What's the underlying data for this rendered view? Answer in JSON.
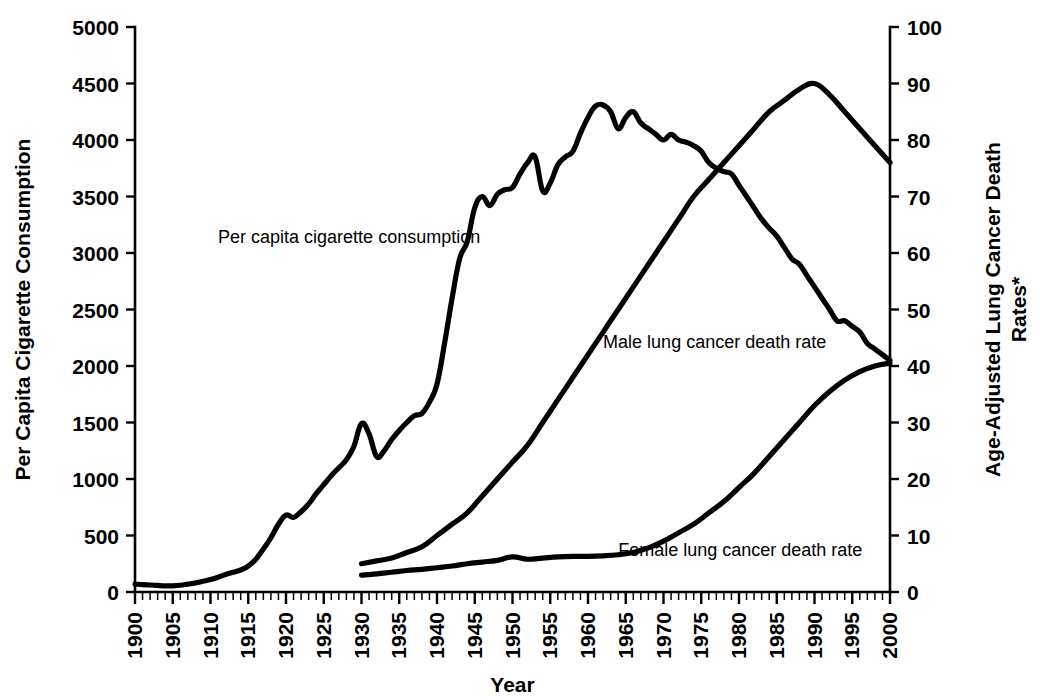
{
  "chart_data": {
    "type": "line",
    "title": "",
    "xlabel": "Year",
    "ylabel": "Per Capita Cigarette Consumption",
    "y2label": "Age-Adjusted Lung Cancer Death Rates*",
    "y2label_line1": "Age-Adjusted Lung Cancer Death",
    "y2label_line2": "Rates*",
    "xlim": [
      1900,
      2000
    ],
    "ylim": [
      0,
      5000
    ],
    "y2lim": [
      0,
      100
    ],
    "grid": false,
    "legend": "inline-annotations",
    "x_ticks": [
      1900,
      1905,
      1910,
      1915,
      1920,
      1925,
      1930,
      1935,
      1940,
      1945,
      1950,
      1955,
      1960,
      1965,
      1970,
      1975,
      1980,
      1985,
      1990,
      1995,
      2000
    ],
    "x_minor_tick_step": 1,
    "y_ticks": [
      0,
      500,
      1000,
      1500,
      2000,
      2500,
      3000,
      3500,
      4000,
      4500,
      5000
    ],
    "y2_ticks": [
      0,
      10,
      20,
      30,
      40,
      50,
      60,
      70,
      80,
      90,
      100
    ],
    "annotations": [
      {
        "text": "Per capita cigarette consumption",
        "x": 1911,
        "y_px": 243
      },
      {
        "text": "Male lung cancer death rate",
        "x": 1962,
        "y_px": 348
      },
      {
        "text": "Female lung cancer death rate",
        "x": 1964,
        "y_px": 556
      }
    ],
    "series": [
      {
        "name": "Per capita cigarette consumption",
        "axis": "left",
        "units": "cigarettes per capita per year",
        "x": [
          1900,
          1901,
          1902,
          1903,
          1904,
          1905,
          1906,
          1907,
          1908,
          1909,
          1910,
          1911,
          1912,
          1913,
          1914,
          1915,
          1916,
          1917,
          1918,
          1919,
          1920,
          1921,
          1922,
          1923,
          1924,
          1925,
          1926,
          1927,
          1928,
          1929,
          1930,
          1931,
          1932,
          1933,
          1934,
          1935,
          1936,
          1937,
          1938,
          1939,
          1940,
          1941,
          1942,
          1943,
          1944,
          1945,
          1946,
          1947,
          1948,
          1949,
          1950,
          1951,
          1952,
          1953,
          1954,
          1955,
          1956,
          1957,
          1958,
          1959,
          1960,
          1961,
          1962,
          1963,
          1964,
          1965,
          1966,
          1967,
          1968,
          1969,
          1970,
          1971,
          1972,
          1973,
          1974,
          1975,
          1976,
          1977,
          1978,
          1979,
          1980,
          1981,
          1982,
          1983,
          1984,
          1985,
          1986,
          1987,
          1988,
          1989,
          1990,
          1991,
          1992,
          1993,
          1994,
          1995,
          1996,
          1997,
          1998,
          1999,
          2000
        ],
        "y": [
          70,
          65,
          62,
          58,
          55,
          55,
          60,
          70,
          80,
          95,
          110,
          130,
          155,
          175,
          195,
          230,
          290,
          380,
          480,
          600,
          680,
          660,
          710,
          780,
          870,
          950,
          1030,
          1100,
          1170,
          1290,
          1490,
          1400,
          1200,
          1250,
          1350,
          1430,
          1500,
          1560,
          1580,
          1680,
          1840,
          2200,
          2600,
          2950,
          3100,
          3400,
          3500,
          3420,
          3520,
          3560,
          3580,
          3700,
          3800,
          3850,
          3550,
          3620,
          3780,
          3850,
          3900,
          4060,
          4200,
          4300,
          4310,
          4250,
          4100,
          4200,
          4250,
          4150,
          4100,
          4050,
          4000,
          4050,
          4000,
          3980,
          3950,
          3900,
          3800,
          3750,
          3720,
          3700,
          3600,
          3500,
          3400,
          3300,
          3220,
          3150,
          3050,
          2950,
          2900,
          2800,
          2700,
          2600,
          2500,
          2400,
          2400,
          2350,
          2300,
          2200,
          2150,
          2100,
          2050
        ]
      },
      {
        "name": "Male lung cancer death rate",
        "axis": "right",
        "units": "deaths per 100,000 population",
        "x": [
          1930,
          1932,
          1934,
          1936,
          1938,
          1940,
          1942,
          1944,
          1946,
          1948,
          1950,
          1952,
          1954,
          1956,
          1958,
          1960,
          1962,
          1964,
          1966,
          1968,
          1970,
          1972,
          1974,
          1976,
          1978,
          1980,
          1982,
          1984,
          1986,
          1988,
          1990,
          1992,
          1994,
          1996,
          1998,
          2000
        ],
        "y": [
          5,
          5.5,
          6,
          7,
          8,
          10,
          12,
          14,
          17,
          20,
          23,
          26,
          30,
          34,
          38,
          42,
          46,
          50,
          54,
          58,
          62,
          66,
          70,
          73,
          76,
          79,
          82,
          85,
          87,
          89,
          90,
          88,
          85,
          82,
          79,
          76
        ]
      },
      {
        "name": "Female lung cancer death rate",
        "axis": "right",
        "units": "deaths per 100,000 population",
        "x": [
          1930,
          1932,
          1934,
          1936,
          1938,
          1940,
          1942,
          1944,
          1946,
          1948,
          1950,
          1952,
          1954,
          1956,
          1958,
          1960,
          1962,
          1964,
          1966,
          1968,
          1970,
          1972,
          1974,
          1976,
          1978,
          1980,
          1982,
          1984,
          1986,
          1988,
          1990,
          1992,
          1994,
          1996,
          1998,
          2000
        ],
        "y": [
          3,
          3.2,
          3.5,
          3.8,
          4,
          4.3,
          4.6,
          5,
          5.3,
          5.6,
          6.2,
          5.8,
          6,
          6.2,
          6.3,
          6.3,
          6.4,
          6.6,
          7,
          7.8,
          9,
          10.5,
          12,
          14,
          16,
          18.5,
          21,
          24,
          27,
          30,
          33,
          35.5,
          37.5,
          39,
          40,
          40.5
        ]
      }
    ]
  },
  "axes": {
    "left": {
      "title": "Per Capita Cigarette Consumption",
      "labels": [
        "5000",
        "4500",
        "4000",
        "3500",
        "3000",
        "2500",
        "2000",
        "1500",
        "1000",
        "500",
        "0"
      ]
    },
    "right": {
      "title_line1": "Age-Adjusted Lung Cancer Death",
      "title_line2": "Rates*",
      "labels": [
        "100",
        "90",
        "80",
        "70",
        "60",
        "50",
        "40",
        "30",
        "20",
        "10",
        "0"
      ]
    },
    "bottom": {
      "title": "Year",
      "labels": [
        "1900",
        "1905",
        "1910",
        "1915",
        "1920",
        "1925",
        "1930",
        "1935",
        "1940",
        "1945",
        "1950",
        "1955",
        "1960",
        "1965",
        "1970",
        "1975",
        "1980",
        "1985",
        "1990",
        "1995",
        "2000"
      ]
    }
  },
  "annotations": {
    "cigarette": "Per capita cigarette consumption",
    "male": "Male lung cancer death rate",
    "female": "Female lung cancer death rate"
  },
  "colors": {
    "line": "#000000",
    "background": "#ffffff",
    "axis": "#000000"
  }
}
